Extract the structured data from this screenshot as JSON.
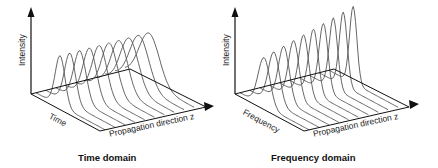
{
  "panels": [
    {
      "id": "time",
      "caption": "Time domain",
      "y_axis_label": "Intensity",
      "depth_axis_label": "Time",
      "x_axis_label": "Propagation direction z",
      "pulse_count": 10,
      "pulse_profile": "constant height, broadening along z"
    },
    {
      "id": "frequency",
      "caption": "Frequency domain",
      "y_axis_label": "Intensity",
      "depth_axis_label": "Frequency",
      "x_axis_label": "Propagation direction z",
      "pulse_count": 10,
      "pulse_profile": "increasing height, narrowing along z"
    }
  ],
  "colors": {
    "axis": "#111111",
    "pulse": "#555555",
    "text": "#222222"
  }
}
